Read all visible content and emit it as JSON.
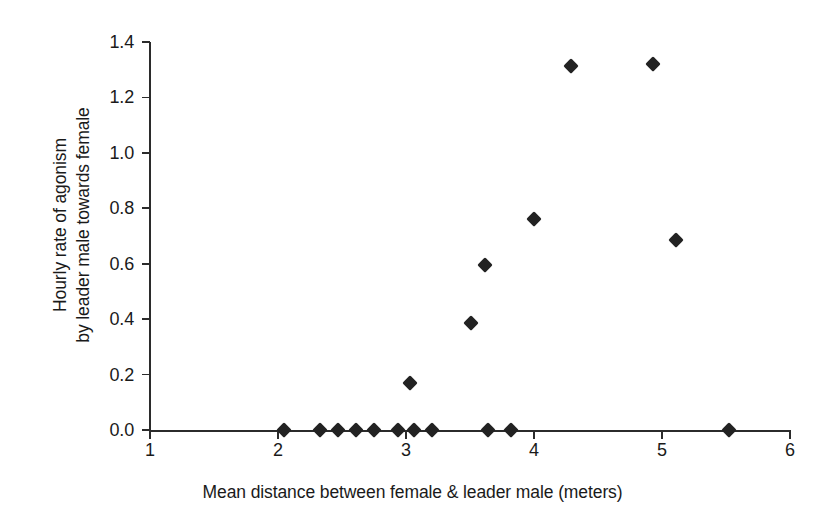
{
  "chart_data": {
    "type": "scatter",
    "title": "",
    "xlabel": "Mean distance between female & leader male (meters)",
    "ylabel": "Hourly rate of agonism\nby leader male towards female",
    "ylabel_lines": [
      "Hourly rate of agonism",
      "by leader male towards female"
    ],
    "xlim": [
      1,
      6
    ],
    "ylim": [
      0.0,
      1.4
    ],
    "xticks": [
      1,
      2,
      3,
      4,
      5,
      6
    ],
    "xtick_labels": [
      "1",
      "2",
      "3",
      "4",
      "5",
      "6"
    ],
    "yticks": [
      0.0,
      0.2,
      0.4,
      0.6,
      0.8,
      1.0,
      1.2,
      1.4
    ],
    "ytick_labels": [
      "0.0",
      "0.2",
      "0.4",
      "0.6",
      "0.8",
      "1.0",
      "1.2",
      "1.4"
    ],
    "grid": false,
    "legend": null,
    "marker": "diamond",
    "marker_color": "#222222",
    "points": [
      {
        "x": 2.05,
        "y": 0.0
      },
      {
        "x": 2.33,
        "y": 0.0
      },
      {
        "x": 2.47,
        "y": 0.0
      },
      {
        "x": 2.61,
        "y": 0.0
      },
      {
        "x": 2.75,
        "y": 0.0
      },
      {
        "x": 2.94,
        "y": 0.0
      },
      {
        "x": 3.06,
        "y": 0.0
      },
      {
        "x": 3.2,
        "y": 0.0
      },
      {
        "x": 3.64,
        "y": 0.0
      },
      {
        "x": 3.82,
        "y": 0.0
      },
      {
        "x": 5.52,
        "y": 0.0
      },
      {
        "x": 3.03,
        "y": 0.17
      },
      {
        "x": 3.51,
        "y": 0.385
      },
      {
        "x": 3.62,
        "y": 0.595
      },
      {
        "x": 4.0,
        "y": 0.76
      },
      {
        "x": 5.11,
        "y": 0.685
      },
      {
        "x": 4.29,
        "y": 1.315
      },
      {
        "x": 4.93,
        "y": 1.32
      }
    ]
  }
}
